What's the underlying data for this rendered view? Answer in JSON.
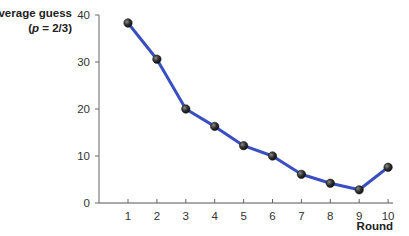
{
  "chart_data": {
    "type": "line",
    "title": "",
    "ylabel": "Average guess",
    "ylabel_sub": "(p = 2/3)",
    "xlabel": "Round",
    "x": [
      1,
      2,
      3,
      4,
      5,
      6,
      7,
      8,
      9,
      10
    ],
    "series": [
      {
        "name": "Average guess (p = 2/3)",
        "values": [
          38.3,
          30.6,
          20.0,
          16.3,
          12.2,
          10.0,
          6.1,
          4.2,
          2.8,
          7.6
        ],
        "color": "#3a4fbf",
        "marker_color": "#2a2a2a"
      }
    ],
    "yticks": [
      0,
      10,
      20,
      30,
      40
    ],
    "xticks": [
      1,
      2,
      3,
      4,
      5,
      6,
      7,
      8,
      9,
      10
    ],
    "ylim": [
      0,
      40
    ],
    "xlim": [
      0,
      10.2
    ],
    "grid": false,
    "legend": "none"
  }
}
